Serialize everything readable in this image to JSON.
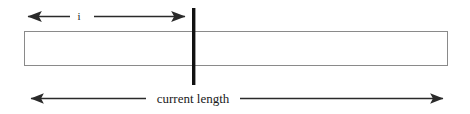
{
  "figure": {
    "type": "array-length-diagram",
    "background_color": "#ffffff",
    "title": "",
    "labels": {
      "index_label": "i",
      "length_label": "current length"
    },
    "colors": {
      "rectangle_border": "#8a8a8a",
      "marker_bar": "#111111",
      "arrow_line": "#2a2a2a",
      "text": "#1a1a1a"
    },
    "rectangle": {
      "x": 24,
      "y": 31,
      "width": 424,
      "height": 34,
      "fill": "#ffffff",
      "stroke_width": 1
    },
    "marker_bar": {
      "x": 193,
      "y_top": 8,
      "y_bottom": 85,
      "width": 3
    },
    "index_arrow": {
      "y": 16,
      "left_tip_x": 25,
      "right_tip_x": 188,
      "label_x": 79,
      "double_headed": true,
      "split_for_label": true
    },
    "length_arrow": {
      "y": 98,
      "left_tip_x": 28,
      "right_tip_x": 446,
      "label_x": 192,
      "label_baseline_y": 104,
      "double_headed": true,
      "split_for_label": true
    }
  }
}
